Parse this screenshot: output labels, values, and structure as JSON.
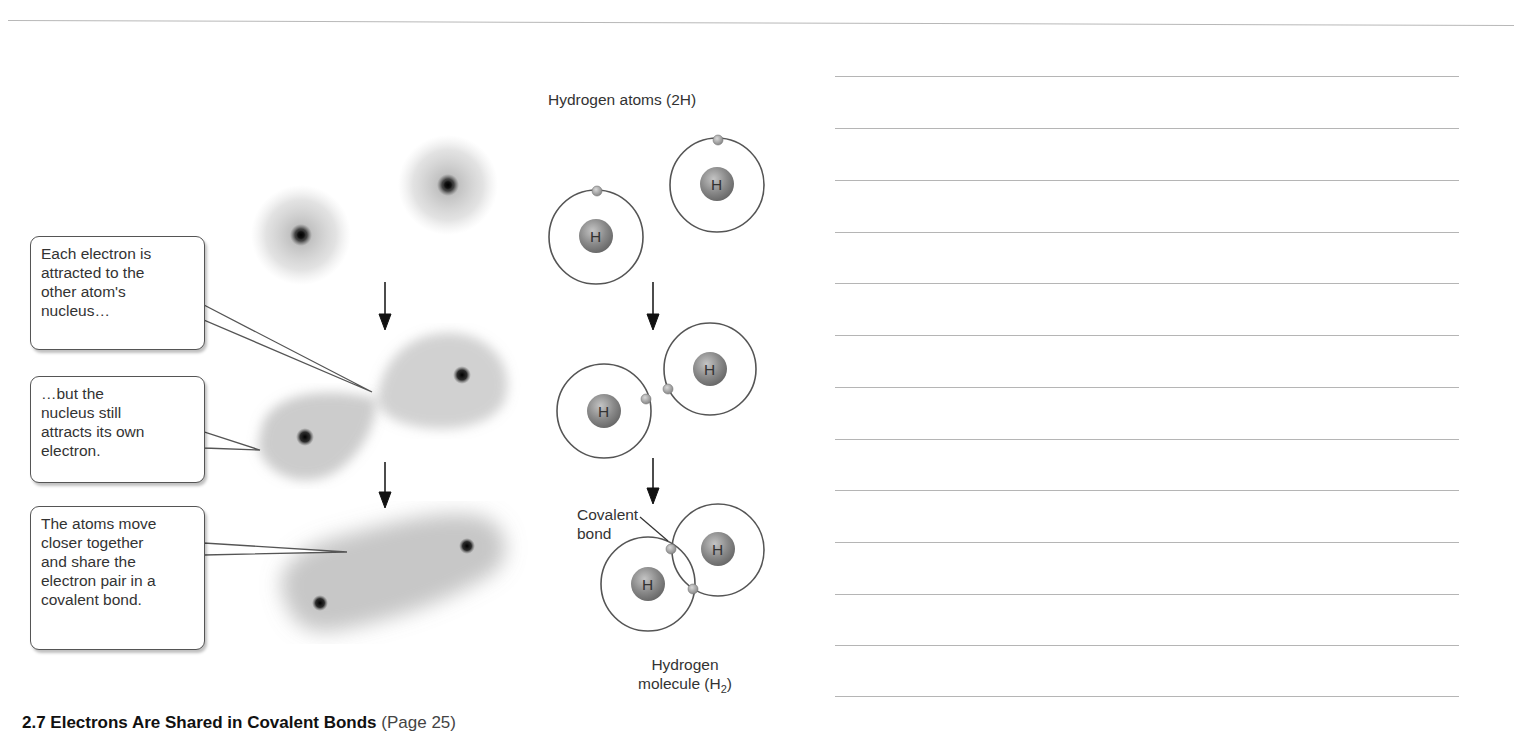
{
  "figure": {
    "caption_title": "2.7 Electrons Are Shared in Covalent Bonds",
    "caption_page_ref": "(Page 25)",
    "callouts": [
      {
        "text": "Each electron is\nattracted to the\nother atom's\nnucleus…"
      },
      {
        "text": "…but the\nnucleus still\nattracts its own\nelectron."
      },
      {
        "text": "The atoms move\ncloser together\nand share the\nelectron pair in a\ncovalent bond."
      }
    ],
    "labels": {
      "atoms_title": "Hydrogen atoms (2H)",
      "bond_label_line1": "Covalent",
      "bond_label_line2": "bond",
      "molecule_line1": "Hydrogen",
      "molecule_line2_prefix": "molecule (H",
      "molecule_subscript": "2",
      "molecule_line2_suffix": ")"
    },
    "nucleus_symbol": "H",
    "stages": [
      {
        "name": "separate-atoms"
      },
      {
        "name": "approaching-atoms"
      },
      {
        "name": "bonded-molecule"
      }
    ],
    "colors": {
      "orbit": "#555555",
      "nucleus": "#8a8a8a",
      "electron": "#9a9a9a",
      "arrow": "#111111",
      "cloud": "#777777"
    }
  },
  "notes": {
    "line_count": 12
  }
}
